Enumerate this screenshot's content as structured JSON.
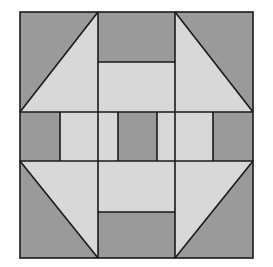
{
  "figure": {
    "title": "Quilt Block Pattern",
    "kind": "geometric-quilt-block",
    "background_color": "#ffffff",
    "canvas": {
      "width": 273,
      "height": 267
    }
  },
  "palette": {
    "dark_gray": "#9a9a9a",
    "light_gray": "#d8d8d8",
    "outline": "#1a1a1a",
    "background": "#ffffff"
  },
  "block": {
    "name": "Churn Dash variation",
    "x": 20,
    "y": 12,
    "width": 233,
    "height": 246,
    "outline_width": 1.6,
    "grid": {
      "columns": [
        20,
        98,
        137,
        175,
        253
      ],
      "rows": [
        12,
        112,
        132,
        161,
        258
      ],
      "column_labels": [
        "left-edge",
        "col-1",
        "center-left",
        "center-right",
        "right-edge"
      ],
      "row_labels": [
        "top-edge",
        "row-1",
        "center-top",
        "center-bottom",
        "bottom-edge"
      ]
    }
  },
  "units": [
    {
      "id": "corner-top-left",
      "type": "half-square-triangle",
      "position": "top-left",
      "dark_corner": "upper-left",
      "light_corner": "lower-right",
      "x": 20,
      "y": 12,
      "w": 78,
      "h": 100
    },
    {
      "id": "corner-top-right",
      "type": "half-square-triangle",
      "position": "top-right",
      "dark_corner": "upper-right",
      "light_corner": "lower-left",
      "x": 175,
      "y": 12,
      "w": 78,
      "h": 100
    },
    {
      "id": "corner-bottom-left",
      "type": "half-square-triangle",
      "position": "bottom-left",
      "dark_corner": "lower-left",
      "light_corner": "upper-right",
      "x": 20,
      "y": 161,
      "w": 78,
      "h": 97
    },
    {
      "id": "corner-bottom-right",
      "type": "half-square-triangle",
      "position": "bottom-right",
      "dark_corner": "lower-right",
      "light_corner": "upper-left",
      "x": 175,
      "y": 161,
      "w": 78,
      "h": 97
    },
    {
      "id": "rail-top",
      "type": "two-bar-rail",
      "position": "top-center",
      "x": 98,
      "y": 12,
      "w": 77,
      "h": 100,
      "bars": [
        {
          "fill": "dark",
          "from": 12,
          "to": 62
        },
        {
          "fill": "light",
          "from": 62,
          "to": 112
        }
      ]
    },
    {
      "id": "rail-bottom",
      "type": "two-bar-rail",
      "position": "bottom-center",
      "x": 98,
      "y": 161,
      "w": 77,
      "h": 97,
      "bars": [
        {
          "fill": "light",
          "from": 161,
          "to": 212
        },
        {
          "fill": "dark",
          "from": 212,
          "to": 258
        }
      ]
    },
    {
      "id": "rail-left",
      "type": "two-bar-rail",
      "position": "middle-left",
      "x": 20,
      "y": 112,
      "w": 78,
      "h": 49,
      "bars": [
        {
          "fill": "dark",
          "from": 20,
          "to": 60
        },
        {
          "fill": "light",
          "from": 60,
          "to": 98
        }
      ]
    },
    {
      "id": "rail-right",
      "type": "two-bar-rail",
      "position": "middle-right",
      "x": 175,
      "y": 112,
      "w": 78,
      "h": 49,
      "bars": [
        {
          "fill": "light",
          "from": 175,
          "to": 213
        },
        {
          "fill": "dark",
          "from": 213,
          "to": 253
        }
      ]
    },
    {
      "id": "center-square",
      "type": "solid-square",
      "position": "center",
      "fill": "dark",
      "x": 118,
      "y": 112,
      "w": 39,
      "h": 49
    },
    {
      "id": "center-left-filler",
      "type": "solid-rect",
      "fill": "light",
      "x": 98,
      "y": 112,
      "w": 20,
      "h": 49
    },
    {
      "id": "center-right-filler",
      "type": "solid-rect",
      "fill": "light",
      "x": 157,
      "y": 112,
      "w": 18,
      "h": 49
    }
  ],
  "legend": {
    "dark_label": "dark gray patch",
    "light_label": "light gray patch",
    "center_label": "center square"
  }
}
